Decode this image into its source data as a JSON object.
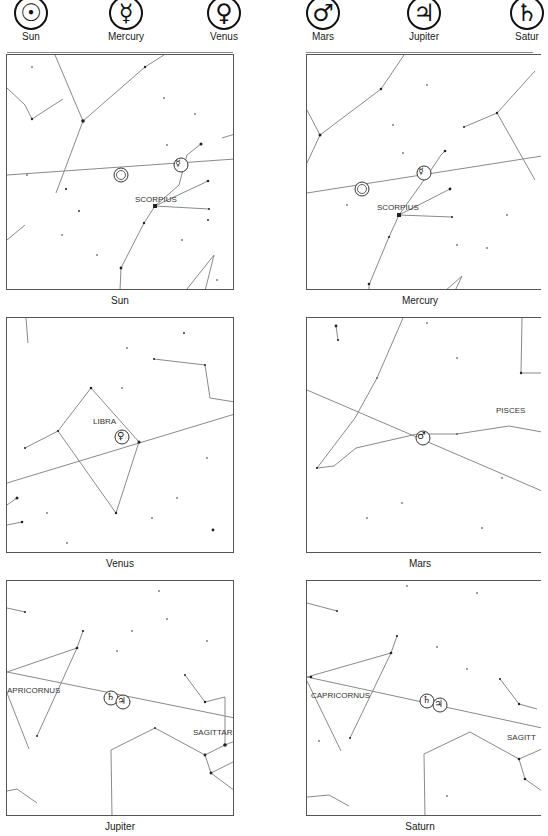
{
  "legend": [
    {
      "name": "Sun",
      "symbol": "☉",
      "icon": "sun-symbol-icon"
    },
    {
      "name": "Mercury",
      "symbol": "☿",
      "icon": "mercury-symbol-icon"
    },
    {
      "name": "Venus",
      "symbol": "♀",
      "icon": "venus-symbol-icon"
    },
    {
      "name": "Mars",
      "symbol": "♂",
      "icon": "mars-symbol-icon"
    },
    {
      "name": "Jupiter",
      "symbol": "♃",
      "icon": "jupiter-symbol-icon"
    },
    {
      "name": "Saturn",
      "symbol": "♄",
      "icon": "saturn-symbol-icon",
      "label_visible": "Satur"
    }
  ],
  "panels": [
    {
      "caption": "Sun",
      "constellation": "SCORPIUS",
      "planets": [
        "☉",
        "☿"
      ]
    },
    {
      "caption": "Mercury",
      "constellation": "SCORPIUS",
      "planets": [
        "☉",
        "☿"
      ]
    },
    {
      "caption": "Venus",
      "constellation": "LIBRA",
      "planets": [
        "♀"
      ]
    },
    {
      "caption": "Mars",
      "constellation": "PISCES",
      "planets": [
        "♂"
      ]
    },
    {
      "caption": "Jupiter",
      "constellation": "APRICORNUS",
      "constellation2": "SAGITTARI",
      "planets": [
        "♄",
        "♃"
      ]
    },
    {
      "caption": "Saturn",
      "constellation": "CAPRICORNUS",
      "constellation2": "SAGITT",
      "planets": [
        "♄",
        "♃"
      ]
    }
  ],
  "colors": {
    "line": "#8a8a8a",
    "star": "#222222",
    "border": "#555555"
  }
}
